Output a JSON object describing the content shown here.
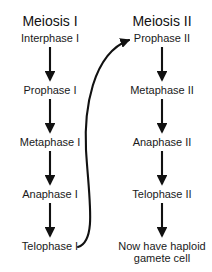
{
  "diagram": {
    "background_color": "#ffffff",
    "line_color": "#111111",
    "text_color": "#1a1a1a",
    "columns": [
      {
        "header": "Meiosis I",
        "header_x": 50,
        "header_y": 21,
        "steps": [
          {
            "label": "Interphase I",
            "x": 50,
            "y": 38
          },
          {
            "label": "Prophase I",
            "x": 50,
            "y": 90
          },
          {
            "label": "Metaphase I",
            "x": 50,
            "y": 142
          },
          {
            "label": "Anaphase I",
            "x": 50,
            "y": 194
          },
          {
            "label": "Telophase I",
            "x": 50,
            "y": 246
          }
        ]
      },
      {
        "header": "Meiosis II",
        "header_x": 162,
        "header_y": 21,
        "steps": [
          {
            "label": "Prophase II",
            "x": 162,
            "y": 38
          },
          {
            "label": "Metaphase II",
            "x": 162,
            "y": 90
          },
          {
            "label": "Anaphase II",
            "x": 162,
            "y": 142
          },
          {
            "label": "Telophase II",
            "x": 162,
            "y": 194
          }
        ]
      }
    ],
    "outcome": {
      "lines": [
        "Now have haploid",
        "gamete cell"
      ],
      "x": 162,
      "y": 252
    },
    "connector": {
      "name": "telophase-i-to-prophase-ii",
      "from": "Telophase I",
      "to": "Prophase II"
    }
  }
}
